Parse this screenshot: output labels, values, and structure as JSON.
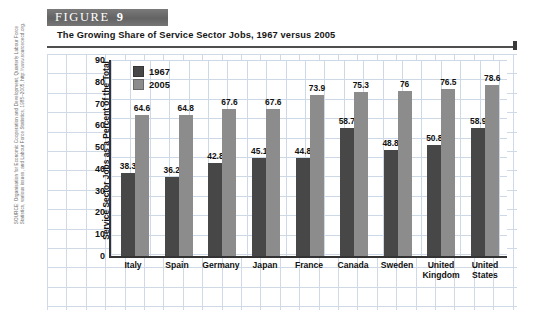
{
  "figure": {
    "label_word": "FIGURE",
    "number": "9",
    "caption": "The Growing Share of Service Sector Jobs, 1967 versus 2005"
  },
  "source_note": "SOURCE: Organisation for Economic Cooperation and Development, Quarterly Labour Force Statistics, various issues, and Labour Force Statistics, 1985–2005, http://www.sourceoecd.org.",
  "colors": {
    "series_1967": "#474747",
    "series_2005": "#8c8c8c",
    "banner": "#6e6e6e",
    "gridline": "#cdd9e6",
    "axis": "#333333"
  },
  "chart_data": {
    "type": "bar",
    "title": "The Growing Share of Service Sector Jobs, 1967 versus 2005",
    "xlabel": "",
    "ylabel": "Service Sector Jobs as a Percent of the Total Labor Force",
    "ylim": [
      0,
      90
    ],
    "yticks": [
      90,
      80,
      70,
      60,
      50,
      40,
      30,
      20,
      10,
      0
    ],
    "grid": true,
    "legend_position": "top-left-inside",
    "categories": [
      "Italy",
      "Spain",
      "Germany",
      "Japan",
      "France",
      "Canada",
      "Sweden",
      "United Kingdom",
      "United States"
    ],
    "series": [
      {
        "name": "1967",
        "color": "#474747",
        "values": [
          38.3,
          36.2,
          42.8,
          45.1,
          44.8,
          58.7,
          48.8,
          50.8,
          58.9
        ],
        "labels": [
          "38.3",
          "36.2",
          "42.8",
          "45.1",
          "44.8",
          "58.7",
          "48.8",
          "50.8",
          "58.9"
        ]
      },
      {
        "name": "2005",
        "color": "#8c8c8c",
        "values": [
          64.6,
          64.8,
          67.6,
          67.6,
          73.9,
          75.3,
          76,
          76.5,
          78.6
        ],
        "labels": [
          "64.6",
          "64.8",
          "67.6",
          "67.6",
          "73.9",
          "75.3",
          "76",
          "76.5",
          "78.6"
        ]
      }
    ]
  }
}
